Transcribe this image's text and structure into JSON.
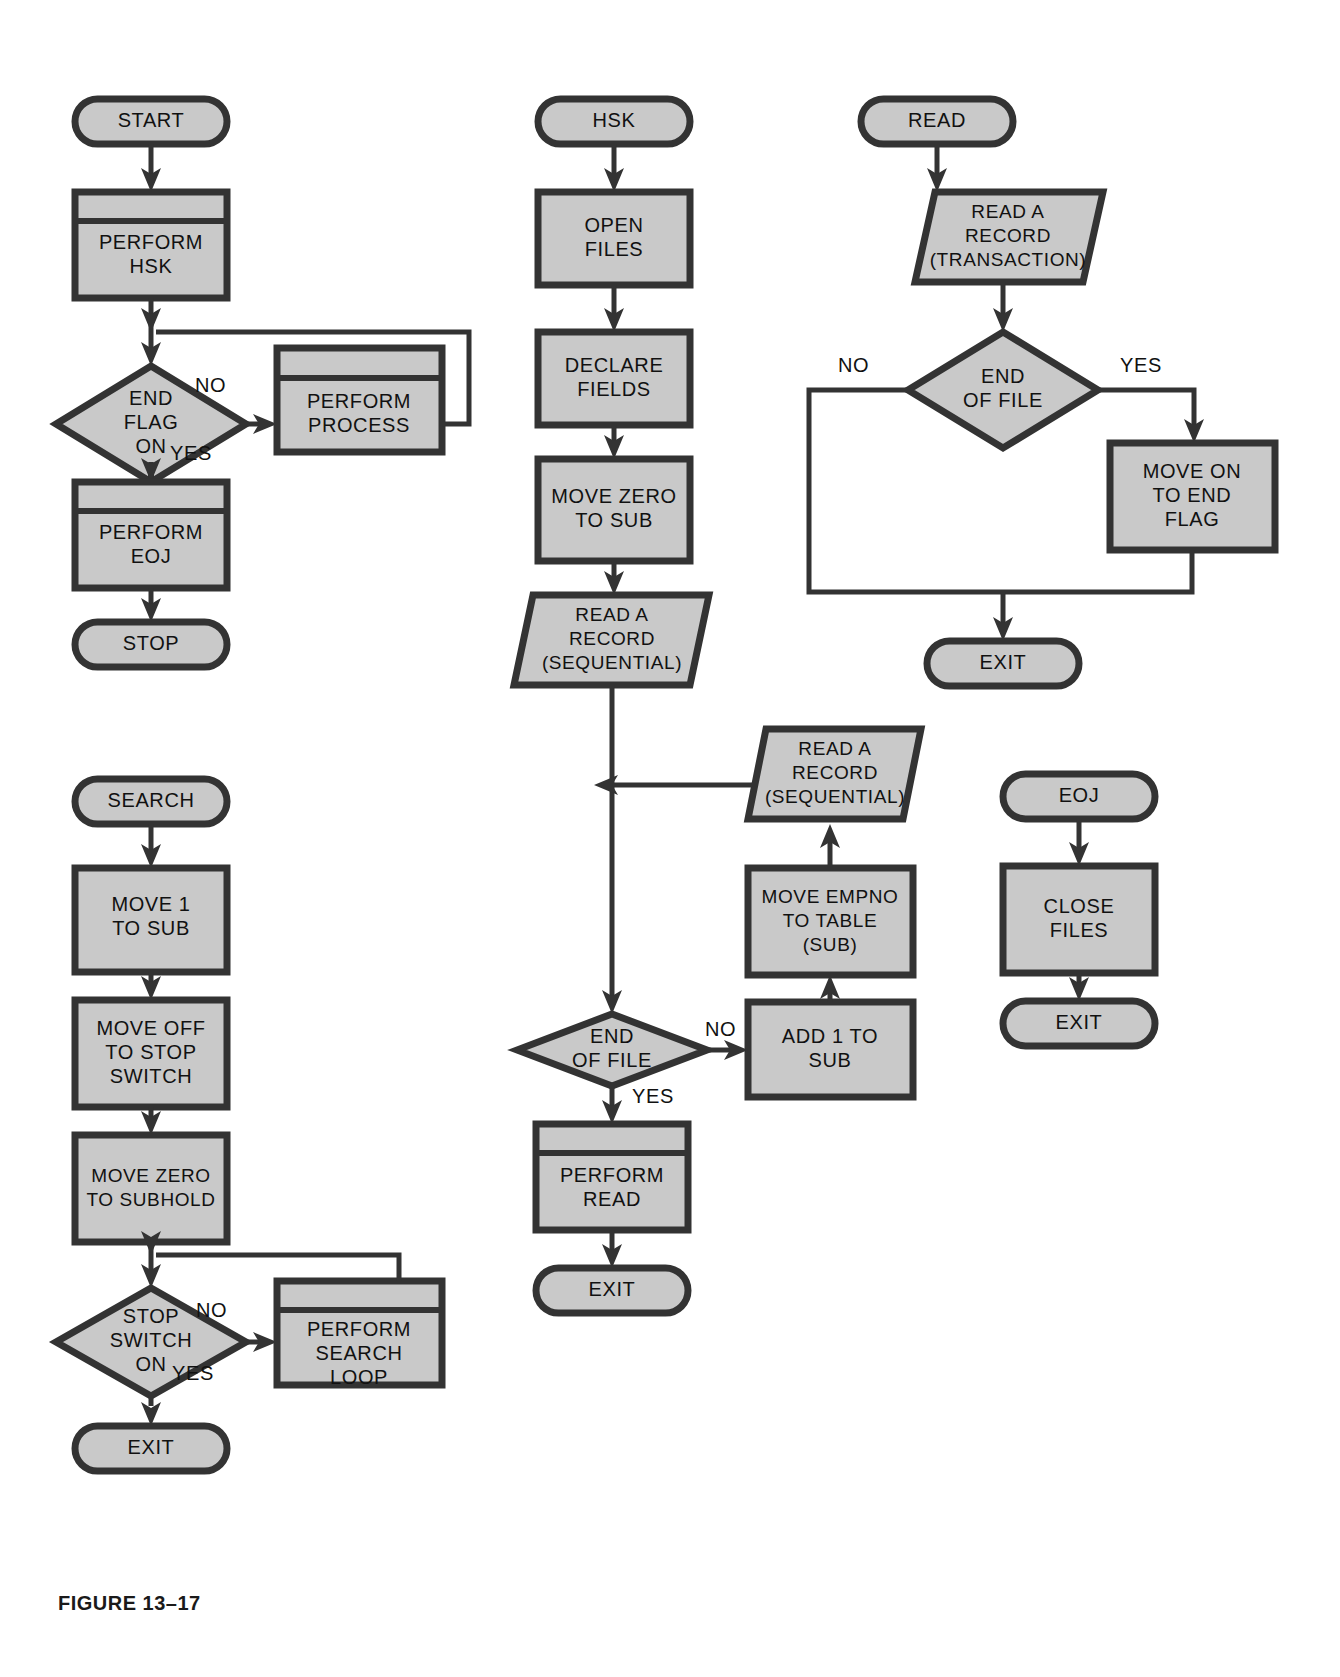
{
  "figure": {
    "caption": "FIGURE 13–17",
    "background_color": "#ffffff",
    "shape_fill_color": "#c9c9c9",
    "shape_stroke_color": "#333333",
    "text_color": "#111111"
  },
  "charts": {
    "main_program": {
      "name": "MAIN",
      "nodes": {
        "start": {
          "label": "START",
          "type": "terminator"
        },
        "perform_hsk": {
          "label_line1": "PERFORM",
          "label_line2": "HSK",
          "type": "predefined-process"
        },
        "end_flag_on": {
          "label_line1": "END",
          "label_line2": "FLAG",
          "label_line3": "ON",
          "type": "decision"
        },
        "perform_process": {
          "label_line1": "PERFORM",
          "label_line2": "PROCESS",
          "type": "predefined-process"
        },
        "perform_eoj": {
          "label_line1": "PERFORM",
          "label_line2": "EOJ",
          "type": "predefined-process"
        },
        "stop": {
          "label": "STOP",
          "type": "terminator"
        }
      },
      "edge_labels": {
        "no": "NO",
        "yes": "YES"
      }
    },
    "hsk_routine": {
      "name": "HSK",
      "nodes": {
        "hsk": {
          "label": "HSK",
          "type": "terminator"
        },
        "open_files": {
          "label_line1": "OPEN",
          "label_line2": "FILES",
          "type": "process"
        },
        "declare_fields": {
          "label_line1": "DECLARE",
          "label_line2": "FIELDS",
          "type": "process"
        },
        "move_zero_to_sub": {
          "label_line1": "MOVE ZERO",
          "label_line2": "TO SUB",
          "type": "process"
        },
        "read_record_sequential_1": {
          "label_line1": "READ A",
          "label_line2": "RECORD",
          "label_line3": "(SEQUENTIAL)",
          "type": "input-output"
        },
        "end_of_file": {
          "label_line1": "END",
          "label_line2": "OF FILE",
          "type": "decision"
        },
        "add_1_to_sub": {
          "label_line1": "ADD 1 TO",
          "label_line2": "SUB",
          "type": "process"
        },
        "move_empno_to_table": {
          "label_line1": "MOVE EMPNO",
          "label_line2": "TO TABLE",
          "label_line3": "(SUB)",
          "type": "process"
        },
        "read_record_sequential_2": {
          "label_line1": "READ A",
          "label_line2": "RECORD",
          "label_line3": "(SEQUENTIAL)",
          "type": "input-output"
        },
        "perform_read": {
          "label_line1": "PERFORM",
          "label_line2": "READ",
          "type": "predefined-process"
        },
        "exit": {
          "label": "EXIT",
          "type": "terminator"
        }
      },
      "edge_labels": {
        "no": "NO",
        "yes": "YES"
      }
    },
    "read_routine": {
      "name": "READ",
      "nodes": {
        "read": {
          "label": "READ",
          "type": "terminator"
        },
        "read_record_transaction": {
          "label_line1": "READ A",
          "label_line2": "RECORD",
          "label_line3": "(TRANSACTION)",
          "type": "input-output"
        },
        "end_of_file": {
          "label_line1": "END",
          "label_line2": "OF FILE",
          "type": "decision"
        },
        "move_on_to_end_flag": {
          "label_line1": "MOVE ON",
          "label_line2": "TO END",
          "label_line3": "FLAG",
          "type": "process"
        },
        "exit": {
          "label": "EXIT",
          "type": "terminator"
        }
      },
      "edge_labels": {
        "no": "NO",
        "yes": "YES"
      }
    },
    "eoj_routine": {
      "name": "EOJ",
      "nodes": {
        "eoj": {
          "label": "EOJ",
          "type": "terminator"
        },
        "close_files": {
          "label_line1": "CLOSE",
          "label_line2": "FILES",
          "type": "process"
        },
        "exit": {
          "label": "EXIT",
          "type": "terminator"
        }
      }
    },
    "search_routine": {
      "name": "SEARCH",
      "nodes": {
        "search": {
          "label": "SEARCH",
          "type": "terminator"
        },
        "move_1_to_sub": {
          "label_line1": "MOVE 1",
          "label_line2": "TO SUB",
          "type": "process"
        },
        "move_off_to_stop_switch": {
          "label_line1": "MOVE OFF",
          "label_line2": "TO STOP",
          "label_line3": "SWITCH",
          "type": "process"
        },
        "move_zero_to_subhold": {
          "label_line1": "MOVE ZERO",
          "label_line2": "TO SUBHOLD",
          "type": "process"
        },
        "stop_switch_on": {
          "label_line1": "STOP",
          "label_line2": "SWITCH",
          "label_line3": "ON",
          "type": "decision"
        },
        "perform_search_loop": {
          "label_line1": "PERFORM",
          "label_line2": "SEARCH",
          "label_line3": "LOOP",
          "type": "predefined-process"
        },
        "exit": {
          "label": "EXIT",
          "type": "terminator"
        }
      },
      "edge_labels": {
        "no": "NO",
        "yes": "YES"
      }
    }
  }
}
